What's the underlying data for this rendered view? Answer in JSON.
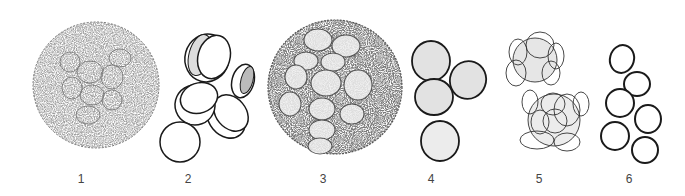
{
  "figure": {
    "panels": [
      {
        "label": "1",
        "description": "large spherical colony, densely stippled, polygonal cell outlines"
      },
      {
        "label": "2",
        "description": "scattered disc-shaped cells, some split halves shaded"
      },
      {
        "label": "3",
        "description": "large spherical colony, darker stippling, distinct polygonal cells"
      },
      {
        "label": "4",
        "description": "four separate stippled oval cells"
      },
      {
        "label": "5",
        "description": "two small clusters of overlapping outlined cells"
      },
      {
        "label": "6",
        "description": "six bold outlined oval cells"
      }
    ],
    "colors": {
      "background": "#ffffff",
      "ink": "#1a1a1a",
      "stipple": "#8a8a8a",
      "label": "#444444"
    }
  }
}
